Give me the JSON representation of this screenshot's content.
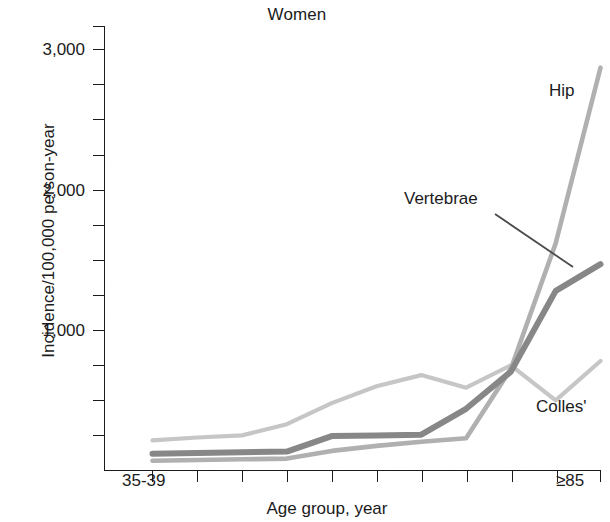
{
  "chart_data": {
    "type": "line",
    "title": "Women",
    "xlabel": "Age group, year",
    "ylabel": "Incidence/100,000 person-year",
    "ylim": [
      0,
      3150
    ],
    "xlim": [
      0,
      10
    ],
    "grid": false,
    "legend_position": "inline-annotations",
    "y_ticks_major": [
      1000,
      2000,
      3000
    ],
    "y_tick_labels": [
      "1,000",
      "2,000",
      "3,000"
    ],
    "y_tick_interval_minor": 250,
    "x_tick_count": 11,
    "x_tick_labels_shown": [
      "35-39",
      "≥85"
    ],
    "categories": [
      "35-39",
      "40-44",
      "45-49",
      "50-54",
      "55-59",
      "60-64",
      "65-69",
      "70-74",
      "75-79",
      "80-84",
      "≥85"
    ],
    "series": [
      {
        "name": "Colles'",
        "color": "#c6c6c6",
        "label_x": 536,
        "label_y": 398,
        "values": [
          215,
          235,
          250,
          330,
          480,
          600,
          680,
          590,
          750,
          500,
          780
        ]
      },
      {
        "name": "Vertebrae",
        "color": "#878787",
        "label_x": 404,
        "label_y": 190,
        "leader_line": [
          [
            495,
            214
          ],
          [
            573,
            267
          ]
        ],
        "values": [
          120,
          125,
          130,
          135,
          245,
          250,
          255,
          440,
          705,
          1280,
          1470
        ]
      },
      {
        "name": "Hip",
        "color": "#b0b0b0",
        "label_x": 549,
        "label_y": 82,
        "values": [
          70,
          75,
          80,
          85,
          140,
          175,
          205,
          230,
          725,
          1620,
          2870
        ]
      }
    ]
  },
  "axis": {
    "title": "Women",
    "y_title": "Incidence/100,000 person-year",
    "x_title": "Age group, year",
    "y_labels": {
      "t3000": "3,000",
      "t2000": "2,000",
      "t1000": "1,000"
    },
    "x_labels": {
      "first": "35-39",
      "last": "≥85"
    },
    "axis_color": "#1b1b1b"
  },
  "annotations": {
    "hip": "Hip",
    "vertebrae": "Vertebrae",
    "colles": "Colles'"
  }
}
